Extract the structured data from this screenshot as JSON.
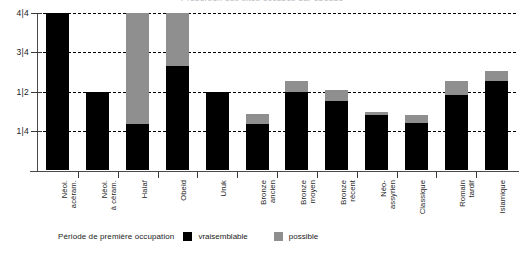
{
  "chart_data": {
    "type": "bar",
    "stacked": true,
    "title": "Proportion des sites occupés par époque",
    "xlabel": "",
    "ylabel": "",
    "ylim": [
      0,
      1
    ],
    "grid": true,
    "y_ticks": [
      {
        "value": 1.0,
        "label": "4|4"
      },
      {
        "value": 0.75,
        "label": "3|4"
      },
      {
        "value": 0.5,
        "label": "1|2"
      },
      {
        "value": 0.25,
        "label": "1|4"
      }
    ],
    "categories": [
      "Néol.\nacéram.",
      "Néol.\nà céram.",
      "Halaf",
      "Obeid",
      "Uruk",
      "Bronze\nancien",
      "Bronze\nmoyen",
      "Bronze\nrécent",
      "Néo-\nassyrien",
      "Classique",
      "Romain\ntardif",
      "Islamique"
    ],
    "series": [
      {
        "name": "vraisemblable",
        "color": "#000000",
        "values": [
          1.0,
          0.5,
          0.29,
          0.66,
          0.5,
          0.29,
          0.5,
          0.44,
          0.35,
          0.3,
          0.48,
          0.57
        ]
      },
      {
        "name": "possible",
        "color": "#8f8f8f",
        "values": [
          0.0,
          0.0,
          0.71,
          0.34,
          0.0,
          0.07,
          0.07,
          0.07,
          0.02,
          0.05,
          0.09,
          0.06
        ]
      }
    ],
    "totals": [
      1.0,
      0.5,
      1.0,
      1.0,
      0.5,
      0.36,
      0.57,
      0.51,
      0.37,
      0.35,
      0.57,
      0.63
    ],
    "legend": {
      "position": "bottom-left",
      "title": "Période de première occupation",
      "entries": [
        {
          "label": "vraisemblable",
          "color": "#000000"
        },
        {
          "label": "possible",
          "color": "#8f8f8f"
        }
      ]
    }
  }
}
